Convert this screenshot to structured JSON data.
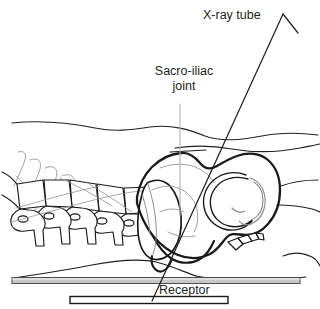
{
  "figure": {
    "background_color": "#ffffff",
    "width": 320,
    "height": 309
  },
  "labels": {
    "xray_tube": "X-ray tube",
    "sacroiliac_joint_line1": "Sacro-iliac",
    "sacroiliac_joint_line2": "joint",
    "receptor": "Receptor"
  },
  "colors": {
    "ink": "#231f20",
    "bone_outline": "#1a1a1a",
    "faint_line": "#8c8c8c",
    "leader_line": "#b3b3b3",
    "table_fill": "#c8c8c8",
    "table_stroke": "#4d4d4d",
    "receptor_fill": "#ffffff",
    "receptor_stroke": "#1a1a1a"
  },
  "elements": {
    "xray_tube_icon": "chevron-tube-icon",
    "central_ray": "beam-line",
    "leader": "leader-line",
    "table": "patient-table",
    "receptor_bar": "image-receptor",
    "skin_contour": "body-skin-outline",
    "vertebrae_count": 6,
    "anatomy_parts": [
      "lumbar-vertebrae",
      "sacrum",
      "ilium",
      "sacro-iliac-joint",
      "acetabulum",
      "femoral-head",
      "coccyx",
      "ribs"
    ]
  }
}
